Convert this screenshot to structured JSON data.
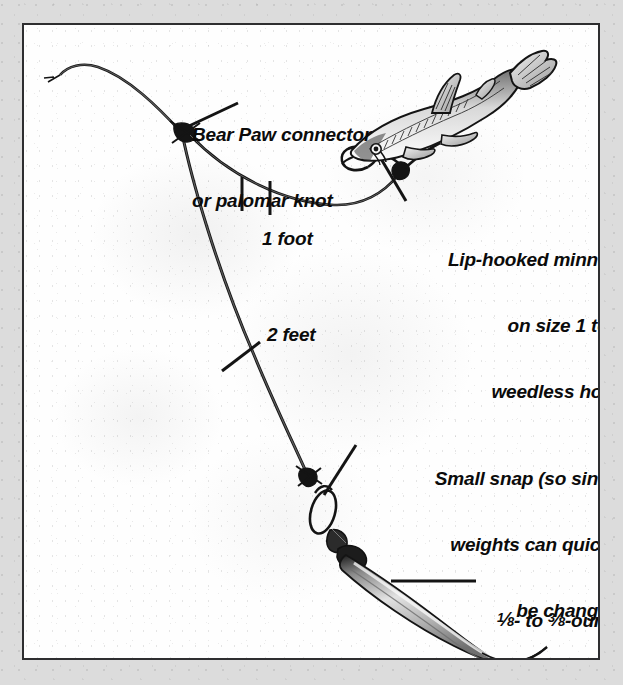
{
  "figure": {
    "border_color": "#2e2e30",
    "matte_color": "#dcdcdc",
    "panel_color": "#fefefe",
    "ink_color": "#111111"
  },
  "labels": {
    "connector": {
      "line1": "Bear Paw connector",
      "line2": "or palomar knot"
    },
    "minnow": {
      "line1": "Lip-hooked minnow",
      "line2": "on size 1 to 2",
      "line3": "weedless hook"
    },
    "one_foot": "1 foot",
    "two_feet": "2 feet",
    "snap": {
      "line1": "Small snap (so sinker",
      "line2": "weights can quickly",
      "line3": "be changed)"
    },
    "sinker": {
      "fraction_low_num": "1",
      "fraction_low_den": "8",
      "fraction_high_num": "3",
      "fraction_high_den": "8",
      "line1_suffix": "- to",
      "line1_tail": "-ounce",
      "line2": "Lindy No-Snagg",
      "line3": "sinker"
    }
  },
  "components": {
    "main_line": "main-line",
    "leader": "leader-line",
    "junction_knot": "junction-knot",
    "hook": "weedless-hook",
    "minnow": "minnow-baitfish",
    "snap": "snap-loop",
    "swivel": "swivel",
    "sinker": "lindy-no-snagg-sinker",
    "tick_marks": "one-foot-tick-marks"
  }
}
